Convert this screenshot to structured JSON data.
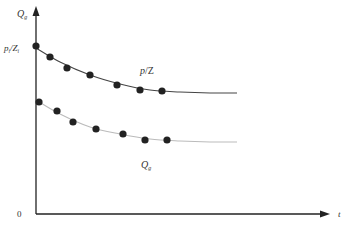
{
  "chart_data": {
    "type": "line",
    "title": "",
    "xlabel": "t",
    "ylabel": "Q_g",
    "origin_label": "0",
    "y_intercept_label": "p_i/Z_i",
    "grid": false,
    "legend": "inline labels",
    "series": [
      {
        "name": "p/Z",
        "label_main": "p",
        "label_sep": "/",
        "label_sub": "Z",
        "line_color": "#444444",
        "marker_color": "#222222",
        "points_px": [
          [
            36,
            46
          ],
          [
            50,
            57
          ],
          [
            67,
            68
          ],
          [
            90,
            75
          ],
          [
            117,
            85
          ],
          [
            140,
            90
          ],
          [
            162,
            91
          ]
        ],
        "curve_px": [
          [
            36,
            48
          ],
          [
            60,
            62
          ],
          [
            90,
            75
          ],
          [
            120,
            84
          ],
          [
            150,
            90
          ],
          [
            180,
            92
          ],
          [
            210,
            93
          ],
          [
            237,
            93
          ]
        ],
        "description": "decreasing, flattening toward a plateau"
      },
      {
        "name": "Q_g",
        "label_main": "Q",
        "label_sub": "g",
        "line_color": "#bbbbbb",
        "marker_color": "#222222",
        "points_px": [
          [
            39,
            102
          ],
          [
            57,
            111
          ],
          [
            73,
            122
          ],
          [
            96,
            129
          ],
          [
            123,
            134
          ],
          [
            145,
            140
          ],
          [
            167,
            140
          ]
        ],
        "curve_px": [
          [
            36,
            100
          ],
          [
            60,
            114
          ],
          [
            90,
            127
          ],
          [
            120,
            134
          ],
          [
            150,
            139
          ],
          [
            180,
            141
          ],
          [
            210,
            142
          ],
          [
            237,
            142
          ]
        ],
        "description": "decreasing, flattening toward a lower plateau"
      }
    ]
  },
  "labels": {
    "y_axis_main": "Q",
    "y_axis_sub": "g",
    "x_axis": "t",
    "origin": "0",
    "intercept_p": "p",
    "intercept_p_sub": "i",
    "intercept_sep": "/Z",
    "intercept_z_sub": "i",
    "upper_curve_main": "p",
    "upper_curve_rest": "/Z",
    "lower_curve_main": "Q",
    "lower_curve_sub": "g"
  }
}
